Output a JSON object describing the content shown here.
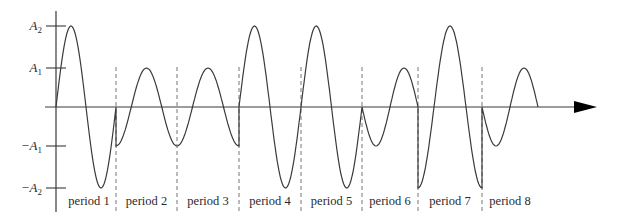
{
  "figure": {
    "type": "waveform-diagram",
    "y_labels": [
      {
        "sign": "",
        "base": "A",
        "sub": "2",
        "level": 2
      },
      {
        "sign": "",
        "base": "A",
        "sub": "1",
        "level": 1
      },
      {
        "sign": "−",
        "base": "A",
        "sub": "1",
        "level": -1
      },
      {
        "sign": "−",
        "base": "A",
        "sub": "2",
        "level": -2
      }
    ],
    "periods": [
      {
        "label": "period 1",
        "amplitude": "A2",
        "phase_deg": 0
      },
      {
        "label": "period 2",
        "amplitude": "A1",
        "phase_deg": 270
      },
      {
        "label": "period 3",
        "amplitude": "A1",
        "phase_deg": 270
      },
      {
        "label": "period 4",
        "amplitude": "A2",
        "phase_deg": 0
      },
      {
        "label": "period 5",
        "amplitude": "A2",
        "phase_deg": 0
      },
      {
        "label": "period 6",
        "amplitude": "A1",
        "phase_deg": 180
      },
      {
        "label": "period 7",
        "amplitude": "A2",
        "phase_deg": 270
      },
      {
        "label": "period 8",
        "amplitude": "A1",
        "phase_deg": 180
      }
    ],
    "colors": {
      "curve": "#3a3a3a",
      "axis": "#3a3a3a",
      "dashed": "#777777",
      "arrow": "#000000"
    }
  },
  "layout": {
    "axis_y": 107,
    "yaxis_x": 56,
    "yaxis_top": 11,
    "yaxis_bottom": 212,
    "xaxis_start": 45,
    "xaxis_end": 580,
    "arrow_tip": 597,
    "level_px": {
      "A1": 39,
      "A2": 81
    },
    "boundaries": [
      56,
      116,
      177,
      239,
      301,
      362,
      418,
      482,
      538
    ],
    "dash_top": 67,
    "dash_bottom": 213,
    "label_y": 205
  }
}
